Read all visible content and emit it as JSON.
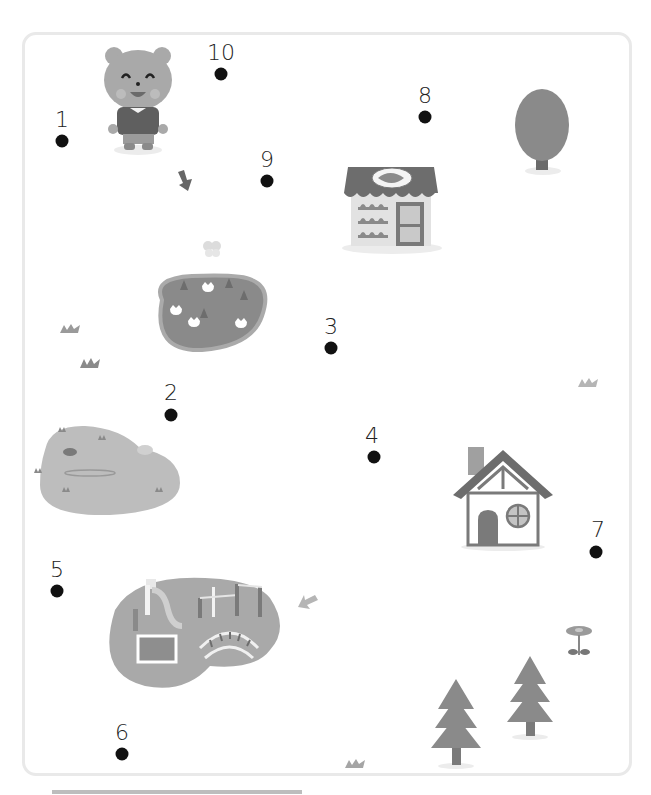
{
  "activity": {
    "type": "connect-the-dots",
    "dot_count": 10
  },
  "dots": [
    {
      "label": "1",
      "x": 62,
      "y": 141
    },
    {
      "label": "2",
      "x": 171,
      "y": 415
    },
    {
      "label": "3",
      "x": 331,
      "y": 348
    },
    {
      "label": "4",
      "x": 374,
      "y": 457
    },
    {
      "label": "5",
      "x": 57,
      "y": 591
    },
    {
      "label": "6",
      "x": 122,
      "y": 754
    },
    {
      "label": "7",
      "x": 596,
      "y": 552
    },
    {
      "label": "8",
      "x": 425,
      "y": 117
    },
    {
      "label": "9",
      "x": 267,
      "y": 181
    },
    {
      "label": "10",
      "x": 221,
      "y": 74
    }
  ],
  "scene_objects": [
    "bear-character",
    "bakery-shop",
    "round-tree",
    "flower-garden",
    "pond",
    "cottage-house",
    "playground",
    "pine-tree",
    "pine-tree-small",
    "flower",
    "arrow-down",
    "arrow-down-left",
    "grass-tufts",
    "butterfly"
  ],
  "colors": {
    "frame_border": "#e9e9e9",
    "dot": "#111111",
    "art_dark": "#6e6e6e",
    "art_mid": "#9a9a9a",
    "art_light": "#bdbdbd",
    "art_pale": "#d8d8d8"
  }
}
